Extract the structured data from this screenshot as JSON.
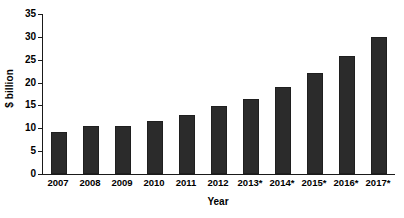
{
  "chart_data": {
    "type": "bar",
    "title": "",
    "xlabel": "Year",
    "ylabel": "$ billion",
    "categories": [
      "2007",
      "2008",
      "2009",
      "2010",
      "2011",
      "2012",
      "2013*",
      "2014*",
      "2015*",
      "2016*",
      "2017*"
    ],
    "values": [
      9.3,
      10.4,
      10.4,
      11.6,
      13.0,
      14.8,
      16.4,
      19.0,
      22.2,
      25.8,
      29.9
    ],
    "series": [
      {
        "name": "$ billion",
        "values": [
          9.3,
          10.4,
          10.4,
          11.6,
          13.0,
          14.8,
          16.4,
          19.0,
          22.2,
          25.8,
          29.9
        ]
      }
    ],
    "ylim": [
      0,
      35
    ],
    "ytick_values": [
      0,
      5,
      10,
      15,
      20,
      25,
      30,
      35
    ],
    "ytick_labels": [
      "0",
      "5",
      "10",
      "15",
      "20",
      "25",
      "30",
      "35"
    ],
    "grid": false,
    "legend": false,
    "legend_position": "none",
    "bar_color": "#2b2b2b",
    "axis_color": "#1a1a1a",
    "background_color": "#ffffff",
    "note": "Years 2013 through 2017 are marked with an asterisk"
  }
}
